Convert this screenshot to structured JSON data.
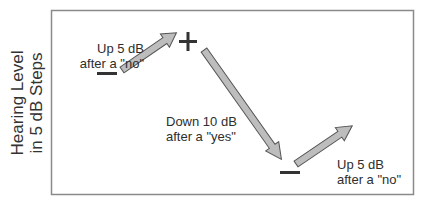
{
  "diagram": {
    "type": "staircase-procedure",
    "y_axis_label": {
      "line1": "Hearing Level",
      "line2": "in 5 dB Steps"
    },
    "annotations": [
      {
        "line1": "Up 5 dB",
        "line2": "after a \"no\""
      },
      {
        "line1": "Down 10 dB",
        "line2": "after a \"yes\""
      },
      {
        "line1": "Up 5 dB",
        "line2": "after a \"no\""
      }
    ],
    "markers": [
      {
        "symbol": "minus",
        "meaning": "no response"
      },
      {
        "symbol": "plus",
        "meaning": "yes response"
      },
      {
        "symbol": "minus",
        "meaning": "no response"
      }
    ],
    "colors": {
      "frame": "#8a8a8a",
      "arrow_fill": "#bdbdbd",
      "arrow_stroke": "#555555",
      "marker": "#333333",
      "text": "#2e2e2e"
    }
  }
}
